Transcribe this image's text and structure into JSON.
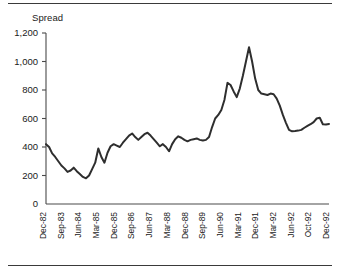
{
  "chart_data": {
    "type": "line",
    "title": "Spread",
    "xlabel": "",
    "ylabel": "",
    "ylim": [
      0,
      1200
    ],
    "yticks": [
      0,
      200,
      400,
      600,
      800,
      1000,
      1200
    ],
    "ytick_labels": [
      "0",
      "200",
      "400",
      "600",
      "800",
      "1,000",
      "1,200"
    ],
    "grid": false,
    "legend": false,
    "xtick_labels": [
      "Dec-82",
      "Sep-83",
      "Jun-84",
      "Mar-85",
      "Dec-85",
      "Sep-86",
      "Jun-87",
      "Mar-88",
      "Dec-88",
      "Sep-89",
      "Jun-90",
      "Mar-91",
      "Dec-91",
      "Mar-92",
      "Jun-92",
      "Oct-92",
      "Dec-92"
    ],
    "series": [
      {
        "name": "Spread",
        "values": [
          420,
          400,
          355,
          330,
          300,
          270,
          250,
          225,
          235,
          255,
          230,
          210,
          190,
          180,
          200,
          245,
          290,
          390,
          330,
          290,
          360,
          405,
          420,
          410,
          400,
          430,
          455,
          480,
          495,
          470,
          450,
          470,
          490,
          500,
          480,
          455,
          430,
          405,
          420,
          400,
          370,
          420,
          455,
          475,
          465,
          450,
          440,
          450,
          455,
          460,
          450,
          445,
          450,
          470,
          540,
          600,
          625,
          660,
          730,
          850,
          835,
          790,
          750,
          810,
          900,
          1000,
          1100,
          1000,
          880,
          800,
          775,
          770,
          765,
          775,
          770,
          740,
          690,
          625,
          570,
          520,
          510,
          512,
          515,
          520,
          535,
          548,
          560,
          575,
          600,
          605,
          560,
          558,
          562
        ]
      }
    ]
  }
}
